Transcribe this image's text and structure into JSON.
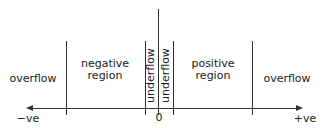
{
  "diagram": {
    "regions": {
      "left_overflow": "overflow",
      "negative_region": [
        "negative",
        "region"
      ],
      "underflow_left": "underflow",
      "underflow_right": "underflow",
      "positive_region": [
        "positive",
        "region"
      ],
      "right_overflow": "overflow"
    },
    "axis": {
      "left_label": "−ve",
      "right_label": "+ve",
      "zero_label": "0"
    }
  }
}
